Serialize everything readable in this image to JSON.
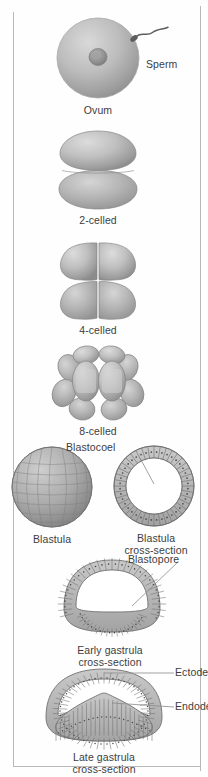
{
  "figure": {
    "colors": {
      "cell_light": "#d2d2d2",
      "cell_mid": "#b2b2b2",
      "cell_dark": "#8c8c8c",
      "outline": "#6f6f6f",
      "text": "#3d3d40",
      "frame": "#b9b9bb",
      "leader": "#8a8a8c",
      "background": "#ffffff"
    }
  },
  "stages": [
    {
      "id": "ovum",
      "caption": "Ovum",
      "icon": "ovum-icon",
      "annotations": [
        {
          "id": "sperm",
          "label": "Sperm",
          "icon": "sperm-icon"
        }
      ],
      "parts": [
        {
          "name": "nucleus"
        },
        {
          "name": "cytoplasm"
        }
      ]
    },
    {
      "id": "two-celled",
      "caption": "2-celled",
      "icon": "two-cell-icon",
      "cell_count": 2,
      "annotations": []
    },
    {
      "id": "four-celled",
      "caption": "4-celled",
      "icon": "four-cell-icon",
      "cell_count": 4,
      "annotations": []
    },
    {
      "id": "eight-celled",
      "caption": "8-celled",
      "icon": "eight-cell-icon",
      "cell_count": 8,
      "annotations": []
    },
    {
      "id": "blastula",
      "caption": "Blastula",
      "icon": "blastula-icon",
      "annotations": []
    },
    {
      "id": "blastula-cross-section",
      "caption": "Blastula\ncross-section",
      "icon": "blastula-cross-section-icon",
      "annotations": [
        {
          "id": "blastocoel",
          "label": "Blastocoel",
          "icon": "leader-line-icon"
        }
      ]
    },
    {
      "id": "early-gastrula-cross-section",
      "caption": "Early gastrula\ncross-section",
      "icon": "early-gastrula-icon",
      "annotations": [
        {
          "id": "blastopore",
          "label": "Blastopore",
          "icon": "leader-line-icon"
        }
      ]
    },
    {
      "id": "late-gastrula-cross-section",
      "caption": "Late gastrula\ncross-section",
      "icon": "late-gastrula-icon",
      "annotations": [
        {
          "id": "ectoderm",
          "label": "Ectoderm",
          "icon": "leader-line-icon"
        },
        {
          "id": "endoderm",
          "label": "Endoderm",
          "icon": "leader-line-icon"
        }
      ]
    }
  ]
}
